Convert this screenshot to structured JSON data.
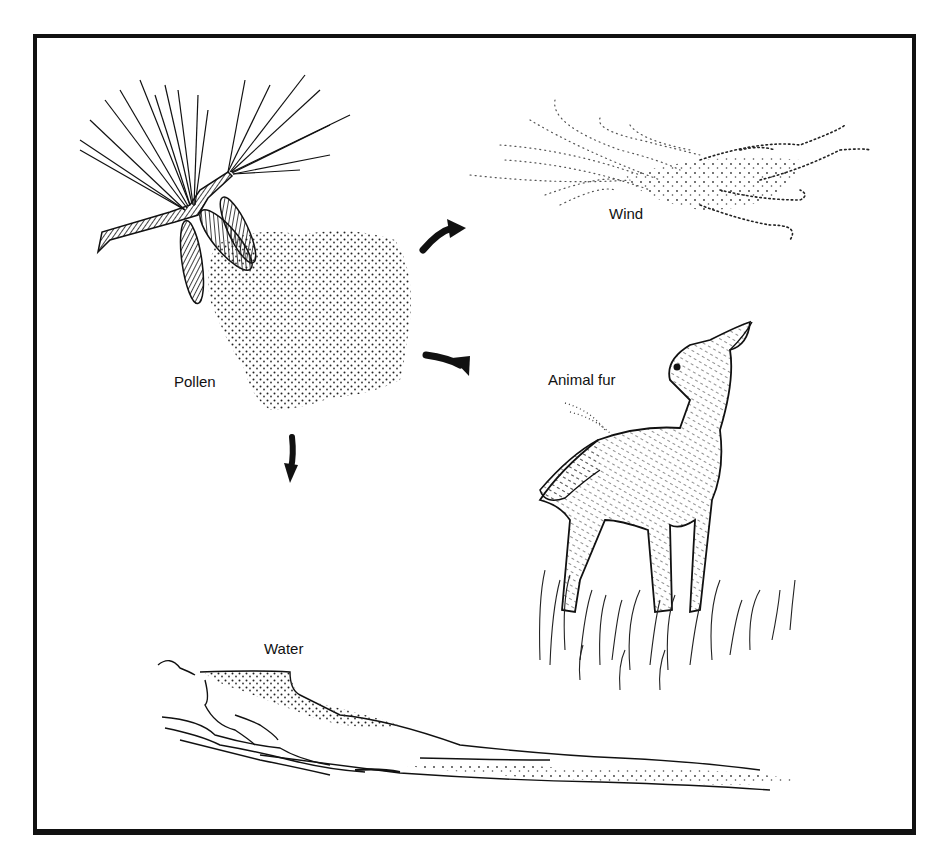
{
  "figure": {
    "type": "pollen-dispersal-illustration",
    "colors": {
      "ink": "#111111",
      "background": "#ffffff"
    },
    "source": {
      "name": "pine-branch-with-cones",
      "label": "Pollen"
    },
    "dispersal_methods": [
      {
        "id": "wind",
        "label": "Wind",
        "arrow": "curved-arrow-up-right"
      },
      {
        "id": "animal",
        "label": "Animal fur",
        "arrow": "curved-arrow-down-right"
      },
      {
        "id": "water",
        "label": "Water",
        "arrow": "arrow-down"
      }
    ]
  }
}
